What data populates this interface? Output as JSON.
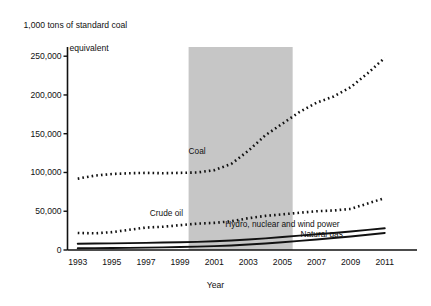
{
  "chart_data": {
    "type": "line",
    "title": "",
    "ylabel_line1": "1,000 tons of standard coal",
    "ylabel_line2": "equivalent",
    "xlabel": "Year",
    "x": [
      1993,
      1994,
      1995,
      1996,
      1997,
      1998,
      1999,
      2000,
      2001,
      2002,
      2003,
      2004,
      2005,
      2006,
      2007,
      2008,
      2009,
      2010,
      2011
    ],
    "xlim": [
      1992.4,
      2011.6
    ],
    "ylim": [
      0,
      258000
    ],
    "xtick_labels": [
      "1993",
      "1995",
      "1997",
      "1999",
      "2001",
      "2003",
      "2005",
      "2007",
      "2009",
      "2011"
    ],
    "xticks": [
      1993,
      1995,
      1997,
      1999,
      2001,
      2003,
      2005,
      2007,
      2009,
      2011
    ],
    "ytick_labels": [
      "0",
      "50,000",
      "100,000",
      "150,000",
      "200,000",
      "250,000"
    ],
    "yticks": [
      0,
      50000,
      100000,
      150000,
      200000,
      250000
    ],
    "grid": false,
    "legend_position": "inline-annotations",
    "shaded_region": {
      "label": "",
      "x_start": 1999.5,
      "x_end": 2005.6,
      "color": "#c6c6c6"
    },
    "series": [
      {
        "name": "Coal",
        "style": "dotted",
        "color": "#111111",
        "label_x": 2000.0,
        "label_y": 128000,
        "values": [
          92000,
          96000,
          98000,
          99000,
          99500,
          99000,
          99500,
          100000,
          103000,
          111000,
          128000,
          148000,
          163000,
          178000,
          190000,
          198000,
          210000,
          228000,
          248000
        ]
      },
      {
        "name": "Crude oil",
        "style": "dotted",
        "color": "#111111",
        "label_x": 1998.2,
        "label_y": 47500,
        "values": [
          22000,
          21500,
          23000,
          26000,
          29000,
          30000,
          32000,
          34000,
          35000,
          37000,
          41000,
          44000,
          46000,
          48000,
          50000,
          51000,
          53000,
          60000,
          67000
        ]
      },
      {
        "name": "Hydro, nuclear and wind power",
        "style": "solid",
        "color": "#111111",
        "label_x": 2005.0,
        "label_y": 34000,
        "values": [
          8000,
          8300,
          8600,
          8900,
          9200,
          9600,
          10000,
          10500,
          11200,
          12200,
          13500,
          15000,
          16800,
          18600,
          20400,
          22000,
          23800,
          26000,
          28000
        ]
      },
      {
        "name": "Natural gas",
        "style": "solid",
        "color": "#111111",
        "label_x": 2007.3,
        "label_y": 20000,
        "values": [
          2200,
          2400,
          2600,
          2800,
          3100,
          3400,
          3800,
          4300,
          5000,
          5900,
          7000,
          8400,
          10000,
          11800,
          13600,
          15400,
          17400,
          19600,
          22000
        ]
      }
    ]
  }
}
